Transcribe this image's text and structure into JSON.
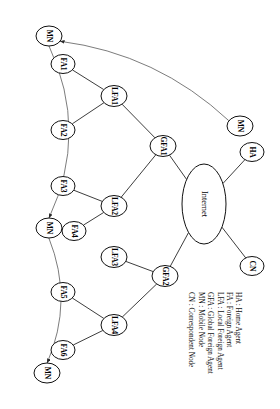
{
  "figure": {
    "rotation_degrees": 90,
    "canvas": {
      "width": 280,
      "height": 409
    },
    "background_color": "#ffffff",
    "stroke_color": "#111111",
    "arc_color": "#5a5a5a"
  },
  "cloud": {
    "label": "Internet",
    "cx": 204,
    "cy": 204,
    "rx": 22,
    "ry": 40
  },
  "nodes": [
    {
      "id": "mn1",
      "label": "MN",
      "cx": 49,
      "cy": 36,
      "rx": 13,
      "ry": 10
    },
    {
      "id": "fa1",
      "label": "FA1",
      "cx": 63,
      "cy": 64,
      "rx": 12,
      "ry": 9.5
    },
    {
      "id": "fa2",
      "label": "FA2",
      "cx": 63,
      "cy": 130,
      "rx": 12,
      "ry": 9.5
    },
    {
      "id": "fa3",
      "label": "FA3",
      "cx": 63,
      "cy": 186,
      "rx": 12,
      "ry": 9.5
    },
    {
      "id": "mn2",
      "label": "MN",
      "cx": 49,
      "cy": 228,
      "rx": 13,
      "ry": 10
    },
    {
      "id": "fa4",
      "label": "FA4",
      "cx": 74,
      "cy": 231,
      "rx": 12,
      "ry": 9.5
    },
    {
      "id": "fa5",
      "label": "FA5",
      "cx": 63,
      "cy": 292,
      "rx": 12,
      "ry": 9.5
    },
    {
      "id": "fa6",
      "label": "FA6",
      "cx": 63,
      "cy": 350,
      "rx": 12,
      "ry": 9.5
    },
    {
      "id": "mn3",
      "label": "MN",
      "cx": 47,
      "cy": 373,
      "rx": 13,
      "ry": 10
    },
    {
      "id": "lfa1",
      "label": "LFA1",
      "cx": 114,
      "cy": 96,
      "rx": 13,
      "ry": 10.5
    },
    {
      "id": "lfa2",
      "label": "LFA2",
      "cx": 114,
      "cy": 206,
      "rx": 13,
      "ry": 10.5
    },
    {
      "id": "lfa3",
      "label": "LFA3",
      "cx": 114,
      "cy": 257,
      "rx": 13,
      "ry": 10.5
    },
    {
      "id": "lfa4",
      "label": "LFA4",
      "cx": 114,
      "cy": 325,
      "rx": 13,
      "ry": 10.5
    },
    {
      "id": "gfa1",
      "label": "GFA1",
      "cx": 163,
      "cy": 146,
      "rx": 13,
      "ry": 10.5
    },
    {
      "id": "gfa2",
      "label": "GFA2",
      "cx": 165,
      "cy": 276,
      "rx": 13,
      "ry": 10.5
    },
    {
      "id": "mn4",
      "label": "MN",
      "cx": 240,
      "cy": 126,
      "rx": 13,
      "ry": 10
    },
    {
      "id": "ha",
      "label": "HA",
      "cx": 252,
      "cy": 152,
      "rx": 12,
      "ry": 9.5
    },
    {
      "id": "cn",
      "label": "CN",
      "cx": 252,
      "cy": 266,
      "rx": 12,
      "ry": 9.5
    }
  ],
  "edges": [
    {
      "from": "fa1",
      "to": "lfa1"
    },
    {
      "from": "fa2",
      "to": "lfa1"
    },
    {
      "from": "lfa1",
      "to": "gfa1"
    },
    {
      "from": "fa3",
      "to": "lfa2"
    },
    {
      "from": "fa4",
      "to": "lfa2"
    },
    {
      "from": "lfa2",
      "to": "gfa1"
    },
    {
      "from": "gfa1",
      "to": "internet"
    },
    {
      "from": "fa5",
      "to": "lfa4"
    },
    {
      "from": "fa6",
      "to": "lfa4"
    },
    {
      "from": "lfa4",
      "to": "gfa2"
    },
    {
      "from": "lfa3",
      "to": "gfa2"
    },
    {
      "from": "gfa2",
      "to": "internet"
    },
    {
      "from": "ha",
      "to": "internet"
    },
    {
      "from": "cn",
      "to": "internet"
    }
  ],
  "movement_arcs": [
    {
      "from": "mn4",
      "to": "mn1",
      "arrow": true,
      "note": "handoff"
    },
    {
      "from": "mn1",
      "to": "mn2",
      "arrow": true,
      "note": "handoff"
    },
    {
      "from": "mn2",
      "to": "mn3",
      "arrow": true,
      "note": "handoff"
    }
  ],
  "legend": {
    "items": [
      "HA : Home Agent",
      "FA : Foreign Agent",
      "LFA : Local Foreign Agent",
      "GFA : Global Foreign Agent",
      "MN : Mobile Node",
      "CN : Correspondent Node"
    ]
  }
}
